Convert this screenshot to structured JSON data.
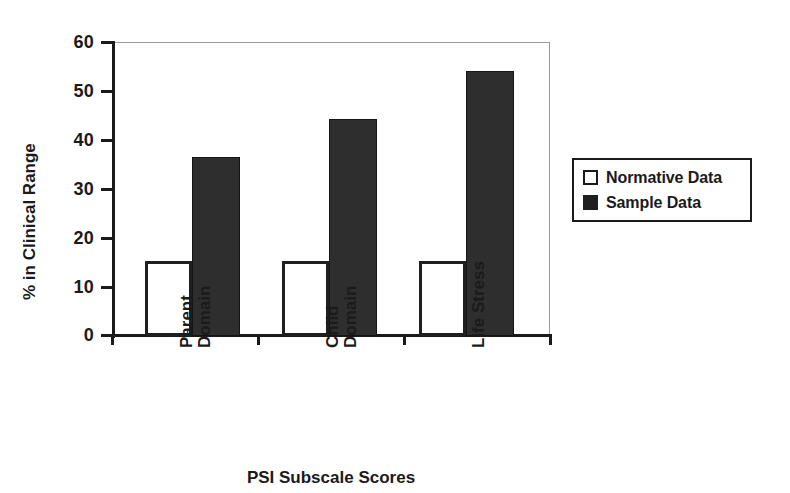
{
  "chart_data": {
    "type": "bar",
    "title": "",
    "subtitle": "",
    "xlabel": "PSI Subscale Scores",
    "ylabel": "% in Clinical Range",
    "categories": [
      "Parent\nDomain",
      "Child\nDomain",
      "Life Stress"
    ],
    "series": [
      {
        "name": "Normative Data",
        "values": [
          15.3,
          15.3,
          15.3
        ],
        "color": "#ffffff",
        "edge_color": "#1f1f1f"
      },
      {
        "name": "Sample Data",
        "values": [
          36.5,
          44.3,
          54.0
        ],
        "color": "#2e2e2e",
        "edge_color": "#151515"
      }
    ],
    "ylim": [
      0,
      60
    ],
    "y_ticks": [
      0,
      10,
      20,
      30,
      40,
      50,
      60
    ],
    "y_tick_labels": [
      "0",
      "10",
      "20",
      "30",
      "40",
      "50",
      "60"
    ],
    "grid": false,
    "legend_position": "right-outside",
    "frame": {
      "top": true,
      "right": true,
      "left": true,
      "bottom": true
    }
  },
  "axes": {
    "y_title": "% in Clinical Range",
    "x_title": "PSI Subscale Scores",
    "y_tick_labels": [
      "60",
      "50",
      "40",
      "30",
      "20",
      "10",
      "0"
    ]
  },
  "legend": {
    "entries": [
      {
        "label": "Normative Data",
        "swatch": "hollow-square-icon"
      },
      {
        "label": "Sample Data",
        "swatch": "filled-square-icon"
      }
    ]
  },
  "categories": [
    {
      "label": "Parent\nDomain"
    },
    {
      "label": "Child\nDomain"
    },
    {
      "label": "Life Stress"
    }
  ]
}
